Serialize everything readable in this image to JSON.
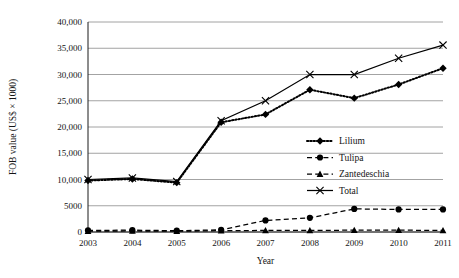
{
  "chart_data": {
    "type": "line",
    "title": "",
    "xlabel": "Year",
    "ylabel": "FOB value (US$ × 1000)",
    "categories": [
      "2003",
      "2004",
      "2005",
      "2006",
      "2007",
      "2008",
      "2009",
      "2010",
      "2011"
    ],
    "x": [
      2003,
      2004,
      2005,
      2006,
      2007,
      2008,
      2009,
      2010,
      2011
    ],
    "ylim": [
      0,
      40000
    ],
    "xlim": [
      2003,
      2011
    ],
    "ytick_labels": [
      "0",
      "5000",
      "10,000",
      "15,000",
      "20,000",
      "25,000",
      "30,000",
      "35,000",
      "40,000"
    ],
    "ytick_values": [
      0,
      5000,
      10000,
      15000,
      20000,
      25000,
      30000,
      35000,
      40000
    ],
    "grid": "horizontal",
    "legend_position": "center-right-inside",
    "series": [
      {
        "name": "Lilium",
        "marker": "diamond",
        "line_style": "dotted",
        "color": "#000000",
        "values": [
          9800,
          10100,
          9400,
          20900,
          22400,
          27100,
          25500,
          28100,
          31200
        ]
      },
      {
        "name": "Tulipa",
        "marker": "circle",
        "line_style": "dashed",
        "color": "#000000",
        "values": [
          300,
          350,
          250,
          400,
          2200,
          2700,
          4400,
          4300,
          4300
        ]
      },
      {
        "name": "Zantedeschia",
        "marker": "triangle",
        "line_style": "dashed",
        "color": "#000000",
        "values": [
          150,
          200,
          150,
          250,
          300,
          300,
          350,
          350,
          300
        ]
      },
      {
        "name": "Total",
        "marker": "x",
        "line_style": "solid",
        "color": "#000000",
        "values": [
          10000,
          10300,
          9600,
          21200,
          25000,
          30000,
          30000,
          33100,
          35600
        ]
      }
    ]
  }
}
